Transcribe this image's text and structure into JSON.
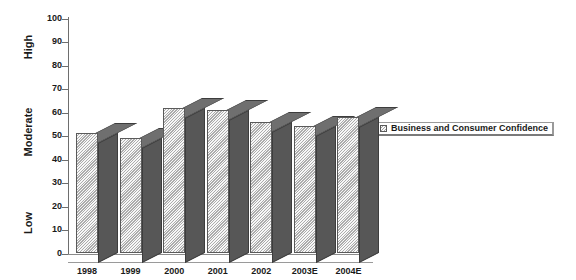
{
  "chart_data": {
    "type": "bar",
    "title": "",
    "subtitle": "",
    "xlabel": "",
    "ylabel": "",
    "categories": [
      "1998",
      "1999",
      "2000",
      "2001",
      "2002",
      "2003E",
      "2004E"
    ],
    "series": [
      {
        "name": "Business and Consumer Confidence",
        "values": [
          51,
          49,
          62,
          61,
          56,
          54,
          58
        ]
      }
    ],
    "ylim": [
      0,
      100
    ],
    "yticks": [
      0,
      10,
      20,
      30,
      40,
      50,
      60,
      70,
      80,
      90,
      100
    ],
    "ytick_labels": [
      "0",
      "10",
      "20",
      "30",
      "40",
      "50",
      "60",
      "70",
      "80",
      "90",
      "100"
    ],
    "band_labels": [
      {
        "text": "High",
        "center_value": 88
      },
      {
        "text": "Moderate",
        "center_value": 52
      },
      {
        "text": "Low",
        "center_value": 13
      }
    ],
    "grid": false,
    "legend": {
      "position": "right",
      "entries": [
        {
          "label": "Business and Consumer Confidence",
          "swatch_name": "legend-swatch-confidence"
        }
      ]
    },
    "style": {
      "background": "#ffffff",
      "bar_front": "#c8c8c8",
      "bar_side": "#575757",
      "bar_top": "#6f6f6f",
      "axis": "#6e6e6e",
      "text": "#1a1a1a"
    }
  }
}
